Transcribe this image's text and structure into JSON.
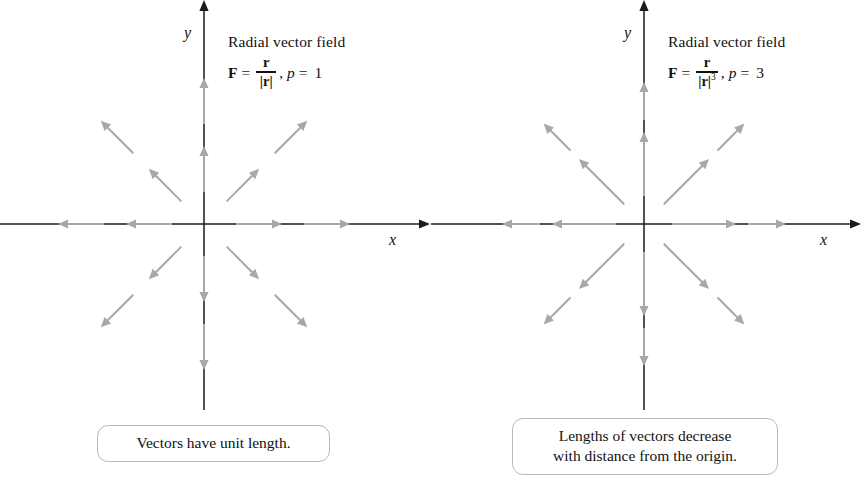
{
  "figure": {
    "background": "#ffffff",
    "axis_color": "#1a1a1a",
    "vector_color": "#a8a8a8"
  },
  "chart_data": {
    "type": "scatter",
    "subtitle": "Comparison of F = r/|r|^p for p = 1 and p = 3",
    "xlabel": "x",
    "ylabel": "y",
    "grid": false,
    "legend": null,
    "panels": [
      {
        "id": "left",
        "label": "Radial vector field",
        "formula": "F = r/|r|, p = 1",
        "p": 1,
        "origin": [
          204,
          224
        ],
        "xlim": [
          -204,
          226
        ],
        "ylim": [
          -186,
          224
        ],
        "caption": "Vectors have unit length.",
        "vector_length_rule": "constant",
        "vectors": [
          {
            "angle": 0,
            "r1": 32,
            "r2": 78,
            "len": 46
          },
          {
            "angle": 0,
            "r1": 100,
            "r2": 146,
            "len": 46
          },
          {
            "angle": 45,
            "r1": 32,
            "r2": 78,
            "len": 46
          },
          {
            "angle": 45,
            "r1": 100,
            "r2": 146,
            "len": 46
          },
          {
            "angle": 90,
            "r1": 32,
            "r2": 78,
            "len": 46
          },
          {
            "angle": 90,
            "r1": 100,
            "r2": 146,
            "len": 46
          },
          {
            "angle": 135,
            "r1": 32,
            "r2": 78,
            "len": 46
          },
          {
            "angle": 135,
            "r1": 100,
            "r2": 146,
            "len": 46
          },
          {
            "angle": 180,
            "r1": 32,
            "r2": 78,
            "len": 46
          },
          {
            "angle": 180,
            "r1": 100,
            "r2": 146,
            "len": 46
          },
          {
            "angle": 225,
            "r1": 32,
            "r2": 78,
            "len": 46
          },
          {
            "angle": 225,
            "r1": 100,
            "r2": 146,
            "len": 46
          },
          {
            "angle": 270,
            "r1": 32,
            "r2": 78,
            "len": 46
          },
          {
            "angle": 270,
            "r1": 100,
            "r2": 146,
            "len": 46
          },
          {
            "angle": 315,
            "r1": 32,
            "r2": 78,
            "len": 46
          },
          {
            "angle": 315,
            "r1": 100,
            "r2": 146,
            "len": 46
          }
        ]
      },
      {
        "id": "right",
        "label": "Radial vector field",
        "formula": "F = r/|r|^3, p = 3",
        "p": 3,
        "origin": [
          213,
          224
        ],
        "xlim": [
          -213,
          217
        ],
        "ylim": [
          -186,
          224
        ],
        "caption_lines": [
          "Lengths of vectors decrease",
          "with distance from the origin."
        ],
        "vector_length_rule": "decreasing",
        "vectors": [
          {
            "angle": 0,
            "r1": 28,
            "r2": 92,
            "len": 64
          },
          {
            "angle": 0,
            "r1": 104,
            "r2": 142,
            "len": 38
          },
          {
            "angle": 45,
            "r1": 28,
            "r2": 92,
            "len": 64
          },
          {
            "angle": 45,
            "r1": 104,
            "r2": 142,
            "len": 38
          },
          {
            "angle": 90,
            "r1": 28,
            "r2": 92,
            "len": 64
          },
          {
            "angle": 90,
            "r1": 104,
            "r2": 142,
            "len": 38
          },
          {
            "angle": 135,
            "r1": 28,
            "r2": 92,
            "len": 64
          },
          {
            "angle": 135,
            "r1": 104,
            "r2": 142,
            "len": 38
          },
          {
            "angle": 180,
            "r1": 28,
            "r2": 92,
            "len": 64
          },
          {
            "angle": 180,
            "r1": 104,
            "r2": 142,
            "len": 38
          },
          {
            "angle": 225,
            "r1": 28,
            "r2": 92,
            "len": 64
          },
          {
            "angle": 225,
            "r1": 104,
            "r2": 142,
            "len": 38
          },
          {
            "angle": 270,
            "r1": 28,
            "r2": 92,
            "len": 64
          },
          {
            "angle": 270,
            "r1": 104,
            "r2": 142,
            "len": 38
          },
          {
            "angle": 315,
            "r1": 28,
            "r2": 92,
            "len": 64
          },
          {
            "angle": 315,
            "r1": 104,
            "r2": 142,
            "len": 38
          }
        ]
      }
    ]
  },
  "left_panel": {
    "axis_x_label": "x",
    "axis_y_label": "y",
    "annotation_title": "Radial vector field",
    "formula": {
      "vector_symbol": "F",
      "equals": "=",
      "numerator": "r",
      "denominator": "|r|",
      "exponent": "",
      "comma": ",",
      "p_symbol": "p",
      "p_equals": "=",
      "p_value": "1"
    },
    "caption": "Vectors have unit length."
  },
  "right_panel": {
    "axis_x_label": "x",
    "axis_y_label": "y",
    "annotation_title": "Radial vector field",
    "formula": {
      "vector_symbol": "F",
      "equals": "=",
      "numerator": "r",
      "denominator": "|r|",
      "exponent": "3",
      "comma": ",",
      "p_symbol": "p",
      "p_equals": "=",
      "p_value": "3"
    },
    "caption_line_1": "Lengths of vectors decrease",
    "caption_line_2": "with distance from the origin."
  }
}
